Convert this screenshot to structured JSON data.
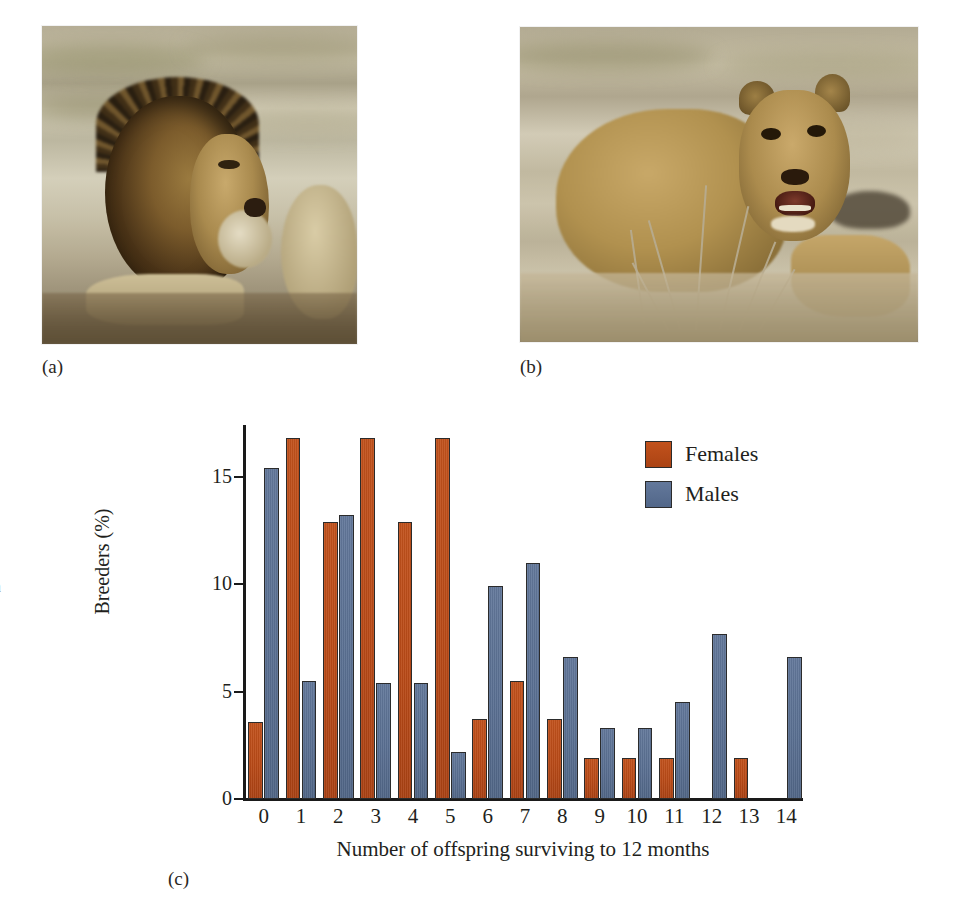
{
  "figure": {
    "panels": [
      {
        "id": "a",
        "label": "(a)",
        "alt": "male-lion-photo"
      },
      {
        "id": "b",
        "label": "(b)",
        "alt": "lioness-photo"
      },
      {
        "id": "c",
        "label": "(c)",
        "alt": "breeding-success-bar-chart"
      }
    ]
  },
  "margin_fragments": [
    "s",
    "n",
    "s",
    "."
  ],
  "chart_data": {
    "type": "bar",
    "title": "",
    "xlabel": "Number of offspring surviving to 12 months",
    "ylabel": "Breeders (%)",
    "ylim": [
      0,
      17.4
    ],
    "yticks": [
      0,
      5,
      10,
      15
    ],
    "ytick_labels": [
      "0",
      "5",
      "10",
      "15"
    ],
    "grid": false,
    "legend_position": "top-right",
    "categories": [
      "0",
      "1",
      "2",
      "3",
      "4",
      "5",
      "6",
      "7",
      "8",
      "9",
      "10",
      "11",
      "12",
      "13",
      "14"
    ],
    "series": [
      {
        "name": "Females",
        "color": "#b94a17",
        "values": [
          3.6,
          16.8,
          12.9,
          16.8,
          12.9,
          16.8,
          3.7,
          5.5,
          3.7,
          1.9,
          1.9,
          1.9,
          0,
          1.9,
          0
        ]
      },
      {
        "name": "Males",
        "color": "#5a7092",
        "values": [
          15.4,
          5.5,
          13.2,
          5.4,
          5.4,
          2.2,
          9.9,
          11.0,
          6.6,
          3.3,
          3.3,
          4.5,
          7.7,
          0,
          6.6
        ]
      }
    ]
  }
}
